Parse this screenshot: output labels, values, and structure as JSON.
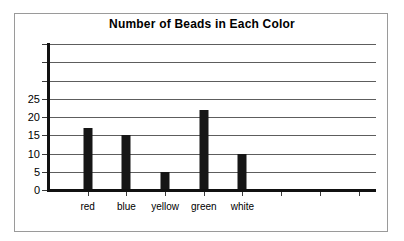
{
  "chart_data": {
    "type": "bar",
    "title": "Number of Beads in Each Color",
    "xlabel": "",
    "ylabel": "",
    "categories": [
      "red",
      "blue",
      "yellow",
      "green",
      "white"
    ],
    "values": [
      17,
      15,
      5,
      22,
      10
    ],
    "ylim": [
      0,
      40
    ],
    "ytick_values": [
      0,
      5,
      10,
      15,
      20,
      25,
      30,
      35,
      40
    ],
    "ytick_labels": [
      "0",
      "5",
      "10",
      "15",
      "20",
      "25",
      "",
      "",
      ""
    ],
    "gridlines": true,
    "legend": null,
    "legend_position": "none",
    "bar_color": "#161616",
    "axis_color": "#111111",
    "grid_color": "#5d5d5d",
    "empty_category_slots": 2
  }
}
